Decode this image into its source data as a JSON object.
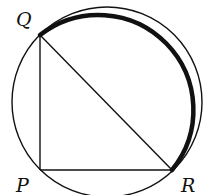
{
  "diagram": {
    "type": "circle with inscribed right triangle",
    "circle": {
      "cx": 107,
      "cy": 102,
      "r": 95
    },
    "points": [
      {
        "name": "Q",
        "x": 40,
        "y": 35
      },
      {
        "name": "P",
        "x": 40,
        "y": 170
      },
      {
        "name": "R",
        "x": 172,
        "y": 170
      }
    ],
    "segments": [
      "QP",
      "PR",
      "QR"
    ],
    "highlighted_arc": "QR (major arc through top-right, drawn bold)"
  },
  "labels": {
    "q": "Q",
    "p": "P",
    "r": "R"
  },
  "colors": {
    "stroke": "#111111",
    "background": "#ffffff"
  }
}
